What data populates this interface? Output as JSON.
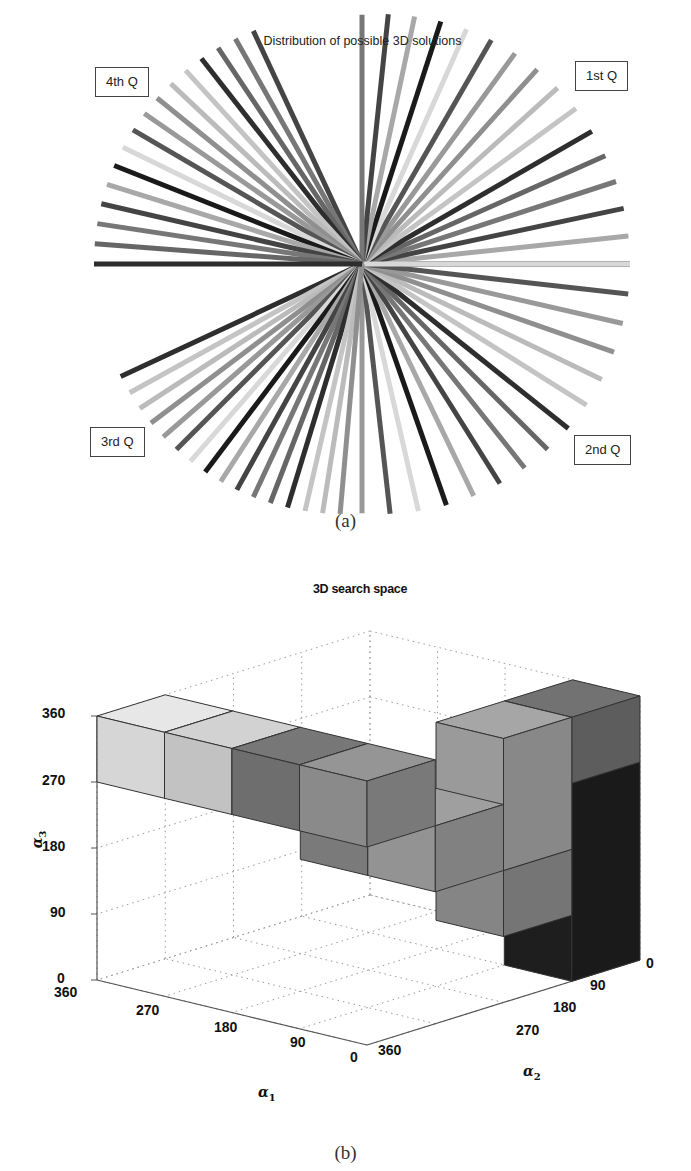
{
  "panel_a": {
    "title": "Distribution of possible 3D solutions",
    "quadrant_labels": {
      "q1": "1st Q",
      "q2": "2nd Q",
      "q3": "3rd Q",
      "q4": "4th Q"
    },
    "caption": "(a)"
  },
  "panel_b": {
    "title": "3D search space",
    "z_ticks": [
      "0",
      "90",
      "180",
      "270",
      "360"
    ],
    "x_ticks": [
      "360",
      "270",
      "180",
      "90",
      "0"
    ],
    "y_ticks": [
      "0",
      "90",
      "180",
      "270",
      "360"
    ],
    "xlabel": "α",
    "xlabel_sub": "1",
    "ylabel": "α",
    "ylabel_sub": "2",
    "zlabel": "α",
    "zlabel_sub": "3",
    "caption": "(b)"
  },
  "chart_data": [
    {
      "type": "polar-lines",
      "title": "Distribution of possible 3D solutions",
      "center_px": [
        362,
        264
      ],
      "radius_px": 268,
      "quadrants": [
        {
          "label": "1st Q",
          "angle_range_deg": [
            0,
            90
          ],
          "line_count": 16
        },
        {
          "label": "2nd Q",
          "angle_range_deg": [
            -90,
            0
          ],
          "line_count": 15
        },
        {
          "label": "3rd Q",
          "angle_range_deg": [
            -155,
            -95
          ],
          "line_count": 16
        },
        {
          "label": "4th Q",
          "angle_range_deg": [
            115,
            180
          ],
          "line_count": 16
        }
      ],
      "line_colors": "grayscale (light to black)"
    },
    {
      "type": "3d-bar",
      "title": "3D search space",
      "xlabel": "α1",
      "ylabel": "α2",
      "zlabel": "α3",
      "xlim": [
        0,
        360
      ],
      "ylim": [
        0,
        360
      ],
      "zlim": [
        0,
        360
      ],
      "x_ticks": [
        0,
        90,
        180,
        270,
        360
      ],
      "y_ticks": [
        0,
        90,
        180,
        270,
        360
      ],
      "z_ticks": [
        0,
        90,
        180,
        270,
        360
      ],
      "grid": true,
      "cell_size": 90,
      "cubes": [
        {
          "a1": [
            270,
            360
          ],
          "a2": [
            270,
            360
          ],
          "a3": [
            270,
            360
          ],
          "shade": "#d6d6d6"
        },
        {
          "a1": [
            180,
            270
          ],
          "a2": [
            270,
            360
          ],
          "a3": [
            270,
            360
          ],
          "shade": "#c2c2c2"
        },
        {
          "a1": [
            90,
            180
          ],
          "a2": [
            270,
            360
          ],
          "a3": [
            270,
            360
          ],
          "shade": "#6e6e6e"
        },
        {
          "a1": [
            0,
            90
          ],
          "a2": [
            270,
            360
          ],
          "a3": [
            270,
            360
          ],
          "shade": "#8a8a8a"
        },
        {
          "a1": [
            90,
            180
          ],
          "a2": [
            180,
            270
          ],
          "a3": [
            180,
            270
          ],
          "shade": "#7a7a7a"
        },
        {
          "a1": [
            0,
            90
          ],
          "a2": [
            180,
            270
          ],
          "a3": [
            180,
            270
          ],
          "shade": "#939393"
        },
        {
          "a1": [
            0,
            90
          ],
          "a2": [
            90,
            180
          ],
          "a3": [
            90,
            180
          ],
          "shade": "#858585"
        },
        {
          "a1": [
            0,
            90
          ],
          "a2": [
            0,
            90
          ],
          "a3": [
            0,
            270
          ],
          "shade": "#1e1e1e"
        },
        {
          "a1": [
            0,
            90
          ],
          "a2": [
            0,
            90
          ],
          "a3": [
            270,
            360
          ],
          "shade": "#6a6a6a"
        },
        {
          "a1": [
            0,
            90
          ],
          "a2": [
            90,
            180
          ],
          "a3": [
            180,
            360
          ],
          "shade": "#9a9a9a"
        }
      ]
    }
  ]
}
